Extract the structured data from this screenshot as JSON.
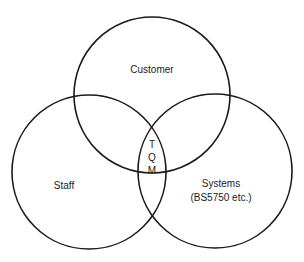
{
  "diagram": {
    "type": "venn",
    "circles": [
      {
        "id": "customer",
        "label": "Customer",
        "cx": 152,
        "cy": 95,
        "r": 78
      },
      {
        "id": "staff",
        "label": "Staff",
        "cx": 89,
        "cy": 172,
        "r": 77
      },
      {
        "id": "systems",
        "label": "Systems",
        "sublabel": "(BS5750 etc.)",
        "cx": 215,
        "cy": 171,
        "r": 77
      }
    ],
    "intersection": {
      "letters": [
        "T",
        "Q",
        "M"
      ],
      "meaning": "TQM"
    },
    "stroke_color": "#1a1a1a",
    "background": "#ffffff"
  }
}
